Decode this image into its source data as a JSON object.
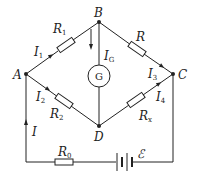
{
  "diagram": {
    "type": "Wheatstone bridge circuit",
    "nodes": {
      "A": "A",
      "B": "B",
      "C": "C",
      "D": "D"
    },
    "galvanometer": "G",
    "resistors": {
      "r1": {
        "main": "R",
        "sub": "1"
      },
      "r": {
        "main": "R",
        "sub": ""
      },
      "r2": {
        "main": "R",
        "sub": "2"
      },
      "rx": {
        "main": "R",
        "sub": "x"
      },
      "r0": {
        "main": "R",
        "sub": "0"
      }
    },
    "currents": {
      "i1": {
        "main": "I",
        "sub": "1"
      },
      "i2": {
        "main": "I",
        "sub": "2"
      },
      "i3": {
        "main": "I",
        "sub": "3"
      },
      "i4": {
        "main": "I",
        "sub": "4"
      },
      "ig": {
        "main": "I",
        "sub": "G"
      },
      "i": {
        "main": "I",
        "sub": ""
      }
    },
    "emf": "ℰ",
    "colors": {
      "line": "#222222",
      "background": "#ffffff"
    }
  }
}
